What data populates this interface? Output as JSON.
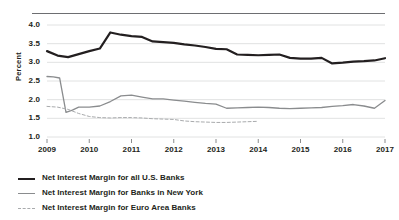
{
  "chart_data": {
    "type": "line",
    "title": "",
    "xlabel": "",
    "ylabel": "Percent",
    "ylim": [
      1.0,
      4.0
    ],
    "xlim": [
      2009.0,
      2017.0
    ],
    "grid": true,
    "legend_position": "below",
    "ytick_labels": [
      "4.0",
      "3.5",
      "3.0",
      "2.5",
      "2.0",
      "1.5",
      "1.0"
    ],
    "ytick_values": [
      4.0,
      3.5,
      3.0,
      2.5,
      2.0,
      1.5,
      1.0
    ],
    "xtick_labels": [
      "2009",
      "2010",
      "2011",
      "2012",
      "2013",
      "2014",
      "2015",
      "2016",
      "2017"
    ],
    "xtick_values": [
      2009,
      2010,
      2011,
      2012,
      2013,
      2014,
      2015,
      2016,
      2017
    ],
    "colors": {
      "us_banks": "#231f20",
      "ny_banks": "#8a8c8e",
      "euro_banks": "#a9abad",
      "gridline": "#d9dadb",
      "rule": "#6d6e71"
    },
    "series": [
      {
        "name": "Net Interest Margin for all U.S. Banks",
        "style": "solid",
        "width": 2.2,
        "color": "#231f20",
        "x": [
          2009.0,
          2009.25,
          2009.5,
          2009.75,
          2010.0,
          2010.25,
          2010.5,
          2010.75,
          2011.0,
          2011.25,
          2011.5,
          2011.75,
          2012.0,
          2012.25,
          2012.5,
          2012.75,
          2013.0,
          2013.25,
          2013.5,
          2013.75,
          2014.0,
          2014.25,
          2014.5,
          2014.75,
          2015.0,
          2015.25,
          2015.5,
          2015.75,
          2016.0,
          2016.25,
          2016.5,
          2016.75,
          2017.0
        ],
        "values": [
          3.3,
          3.18,
          3.14,
          3.22,
          3.3,
          3.37,
          3.8,
          3.74,
          3.7,
          3.68,
          3.56,
          3.54,
          3.52,
          3.48,
          3.45,
          3.41,
          3.36,
          3.35,
          3.21,
          3.2,
          3.19,
          3.2,
          3.21,
          3.12,
          3.1,
          3.1,
          3.12,
          2.97,
          2.99,
          3.02,
          3.03,
          3.05,
          3.11
        ]
      },
      {
        "name": "Net Interest Margin for Banks in New York",
        "style": "solid",
        "width": 1.3,
        "color": "#8a8c8e",
        "x": [
          2009.0,
          2009.15,
          2009.3,
          2009.45,
          2009.6,
          2009.75,
          2010.0,
          2010.25,
          2010.5,
          2010.75,
          2011.0,
          2011.25,
          2011.5,
          2011.75,
          2012.0,
          2012.25,
          2012.5,
          2012.75,
          2013.0,
          2013.25,
          2013.5,
          2013.75,
          2014.0,
          2014.25,
          2014.5,
          2014.75,
          2015.0,
          2015.25,
          2015.5,
          2015.75,
          2016.0,
          2016.25,
          2016.5,
          2016.75,
          2017.0
        ],
        "values": [
          2.62,
          2.61,
          2.58,
          1.66,
          1.72,
          1.8,
          1.8,
          1.83,
          1.95,
          2.1,
          2.12,
          2.07,
          2.02,
          2.02,
          1.99,
          1.96,
          1.93,
          1.9,
          1.88,
          1.77,
          1.78,
          1.79,
          1.8,
          1.79,
          1.77,
          1.76,
          1.77,
          1.78,
          1.79,
          1.82,
          1.84,
          1.87,
          1.83,
          1.77,
          1.98
        ]
      },
      {
        "name": "Net Interest Margin for Euro Area Banks",
        "style": "dashed",
        "width": 1.0,
        "color": "#a9abad",
        "x": [
          2009.0,
          2009.25,
          2009.5,
          2009.75,
          2010.0,
          2010.25,
          2010.5,
          2010.75,
          2011.0,
          2011.25,
          2011.5,
          2011.75,
          2012.0,
          2012.25,
          2012.5,
          2012.75,
          2013.0,
          2013.25,
          2013.5,
          2013.75,
          2014.0
        ],
        "values": [
          1.82,
          1.8,
          1.74,
          1.63,
          1.55,
          1.52,
          1.51,
          1.52,
          1.52,
          1.51,
          1.49,
          1.48,
          1.47,
          1.43,
          1.41,
          1.4,
          1.39,
          1.39,
          1.4,
          1.41,
          1.42
        ]
      }
    ]
  },
  "legend": {
    "items": [
      {
        "label": "Net Interest Margin for all U.S. Banks",
        "style": "solid-dark"
      },
      {
        "label": "Net Interest Margin for Banks in New York",
        "style": "solid-gray"
      },
      {
        "label": "Net Interest Margin for Euro Area Banks",
        "style": "dashed-gray"
      }
    ]
  },
  "axis": {
    "y_title": "Percent"
  }
}
